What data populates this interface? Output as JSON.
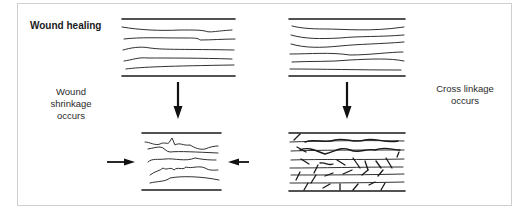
{
  "diagram": {
    "title": "Wound healing",
    "left_label": {
      "line1": "Wound",
      "line2": "shrinkage",
      "line3": "occurs"
    },
    "right_label": {
      "line1": "Cross linkage",
      "line2": "occurs"
    },
    "panels": [
      {
        "id": "left-before",
        "description": "parallel wavy collagen fibers between two boundary lines"
      },
      {
        "id": "left-after",
        "description": "contracted, crumpled fibers with inward compression arrows"
      },
      {
        "id": "right-before",
        "description": "parallel wavy collagen fibers between two boundary lines"
      },
      {
        "id": "right-after",
        "description": "fibers joined by many short cross-links"
      }
    ],
    "arrows": [
      {
        "id": "left-down-arrow",
        "direction": "down"
      },
      {
        "id": "right-down-arrow",
        "direction": "down"
      },
      {
        "id": "compress-left-arrow",
        "direction": "right"
      },
      {
        "id": "compress-right-arrow",
        "direction": "left"
      }
    ],
    "colors": {
      "stroke": "#1a1a1a",
      "frame": "#cfcfcf",
      "background": "#ffffff"
    }
  }
}
